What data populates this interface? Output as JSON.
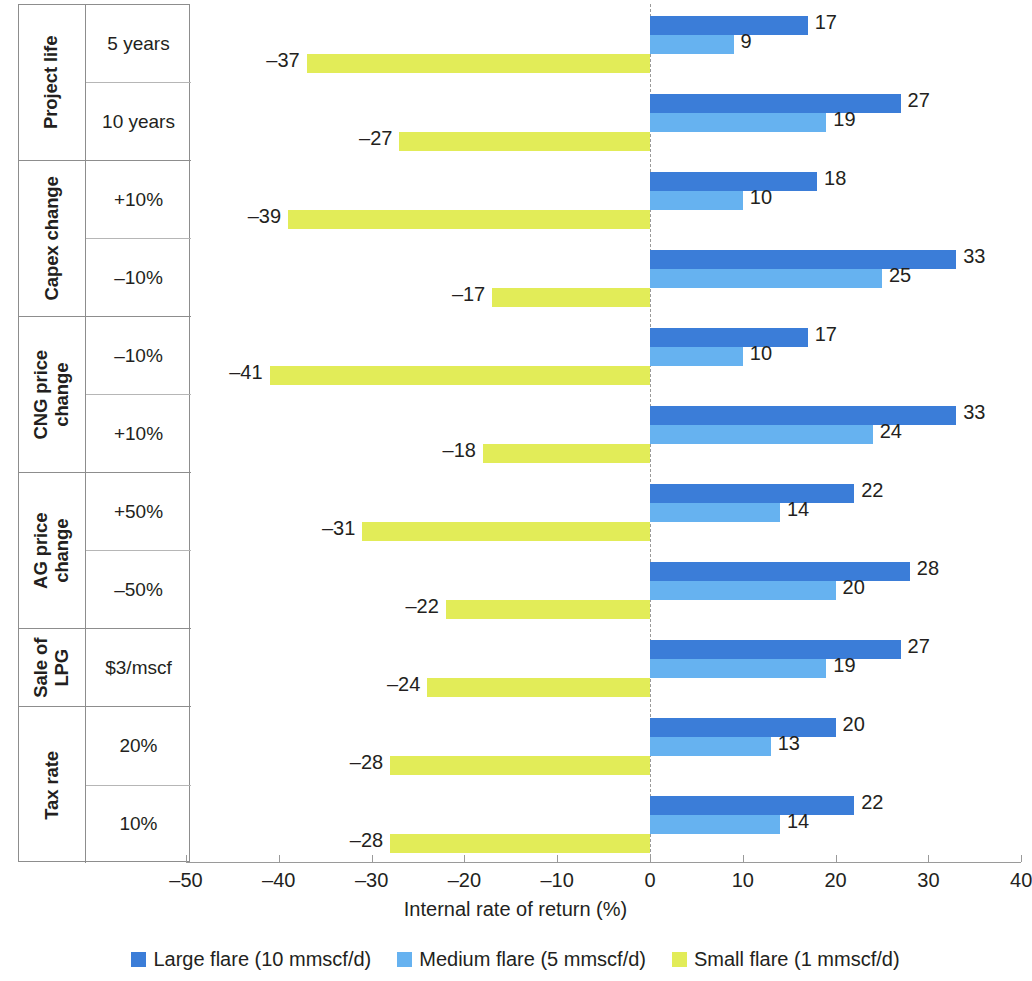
{
  "chart_data": {
    "type": "bar",
    "orientation": "horizontal",
    "title": "",
    "xlabel": "Internal rate of return (%)",
    "ylabel": "",
    "xlim": [
      -50,
      40
    ],
    "xticks": [
      -50,
      -40,
      -30,
      -20,
      -10,
      0,
      10,
      20,
      30,
      40
    ],
    "xtick_labels": [
      "–50",
      "–40",
      "–30",
      "–20",
      "–10",
      "0",
      "10",
      "20",
      "30",
      "40"
    ],
    "grid": false,
    "zero_line": 0,
    "legend_position": "bottom",
    "categories": [
      "5 years",
      "10 years",
      "+10%",
      "–10%",
      "–10%",
      "+10%",
      "+50%",
      "–50%",
      "$3/mscf",
      "20%",
      "10%"
    ],
    "groups": [
      {
        "name": "Project life",
        "name_lines": [
          "Project life"
        ],
        "rows": [
          {
            "label": "5 years",
            "values": {
              "large": 17,
              "medium": 9,
              "small": -37
            },
            "labels": {
              "large": "17",
              "medium": "9",
              "small": "–37"
            }
          },
          {
            "label": "10 years",
            "values": {
              "large": 27,
              "medium": 19,
              "small": -27
            },
            "labels": {
              "large": "27",
              "medium": "19",
              "small": "–27"
            }
          }
        ]
      },
      {
        "name": "Capex change",
        "name_lines": [
          "Capex change"
        ],
        "rows": [
          {
            "label": "+10%",
            "values": {
              "large": 18,
              "medium": 10,
              "small": -39
            },
            "labels": {
              "large": "18",
              "medium": "10",
              "small": "–39"
            }
          },
          {
            "label": "–10%",
            "values": {
              "large": 33,
              "medium": 25,
              "small": -17
            },
            "labels": {
              "large": "33",
              "medium": "25",
              "small": "–17"
            }
          }
        ]
      },
      {
        "name": "CNG price change",
        "name_lines": [
          "CNG price",
          "change"
        ],
        "rows": [
          {
            "label": "–10%",
            "values": {
              "large": 17,
              "medium": 10,
              "small": -41
            },
            "labels": {
              "large": "17",
              "medium": "10",
              "small": "–41"
            }
          },
          {
            "label": "+10%",
            "values": {
              "large": 33,
              "medium": 24,
              "small": -18
            },
            "labels": {
              "large": "33",
              "medium": "24",
              "small": "–18"
            }
          }
        ]
      },
      {
        "name": "AG price change",
        "name_lines": [
          "AG price",
          "change"
        ],
        "rows": [
          {
            "label": "+50%",
            "values": {
              "large": 22,
              "medium": 14,
              "small": -31
            },
            "labels": {
              "large": "22",
              "medium": "14",
              "small": "–31"
            }
          },
          {
            "label": "–50%",
            "values": {
              "large": 28,
              "medium": 20,
              "small": -22
            },
            "labels": {
              "large": "28",
              "medium": "20",
              "small": "–22"
            }
          }
        ]
      },
      {
        "name": "Sale of LPG",
        "name_lines": [
          "Sale of",
          "LPG"
        ],
        "rows": [
          {
            "label": "$3/mscf",
            "values": {
              "large": 27,
              "medium": 19,
              "small": -24
            },
            "labels": {
              "large": "27",
              "medium": "19",
              "small": "–24"
            }
          }
        ]
      },
      {
        "name": "Tax rate",
        "name_lines": [
          "Tax rate"
        ],
        "rows": [
          {
            "label": "20%",
            "values": {
              "large": 20,
              "medium": 13,
              "small": -28
            },
            "labels": {
              "large": "20",
              "medium": "13",
              "small": "–28"
            }
          },
          {
            "label": "10%",
            "values": {
              "large": 22,
              "medium": 14,
              "small": -28
            },
            "labels": {
              "large": "22",
              "medium": "14",
              "small": "–28"
            }
          }
        ]
      }
    ],
    "series": [
      {
        "key": "large",
        "name": "Large flare (10 mmscf/d)",
        "color": "#3b7dd8",
        "values": [
          17,
          27,
          18,
          33,
          17,
          33,
          22,
          28,
          27,
          20,
          22
        ]
      },
      {
        "key": "medium",
        "name": "Medium flare (5 mmscf/d)",
        "color": "#66b2f0",
        "values": [
          9,
          19,
          10,
          25,
          10,
          24,
          14,
          20,
          19,
          13,
          14
        ]
      },
      {
        "key": "small",
        "name": "Small flare (1 mmscf/d)",
        "color": "#e2ec58",
        "values": [
          -37,
          -27,
          -39,
          -17,
          -41,
          -18,
          -31,
          -22,
          -24,
          -28,
          -28
        ]
      }
    ]
  },
  "legend": {
    "items": [
      {
        "label": "Large flare (10 mmscf/d)",
        "color": "#3b7dd8"
      },
      {
        "label": "Medium flare (5 mmscf/d)",
        "color": "#66b2f0"
      },
      {
        "label": "Small flare (1 mmscf/d)",
        "color": "#e2ec58"
      }
    ]
  },
  "axis": {
    "title": "Internal rate of return (%)"
  }
}
